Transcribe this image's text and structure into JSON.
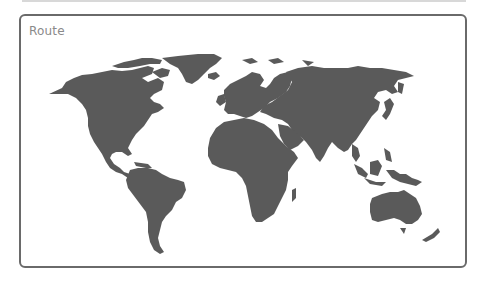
{
  "panel": {
    "title": "Route"
  },
  "map": {
    "type": "world-map",
    "land_color": "#5a5a5a",
    "water_color": "#ffffff",
    "frame_color": "#6a6a6a",
    "regions": [
      "north-america",
      "greenland",
      "south-america",
      "europe",
      "africa",
      "asia",
      "oceania"
    ]
  }
}
